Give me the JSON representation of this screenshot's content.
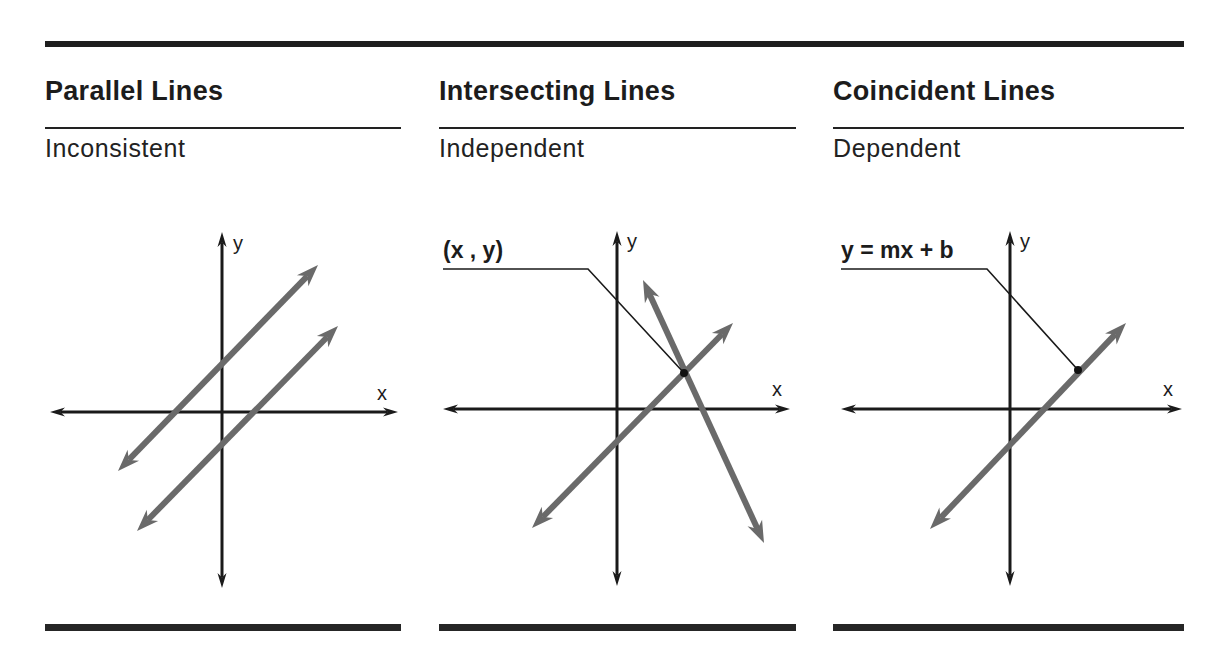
{
  "panels": [
    {
      "id": "parallel",
      "title": "Parallel Lines",
      "subtitle": "Inconsistent",
      "left": 45,
      "width": 356,
      "axes": {
        "y_axis": {
          "x": 222,
          "top": 232,
          "bottom": 588
        },
        "x_axis": {
          "y": 412,
          "left": 50,
          "right": 398
        },
        "y_label": "y",
        "y_label_pos": [
          233,
          250
        ],
        "x_label": "x",
        "x_label_pos": [
          377,
          400
        ]
      },
      "lines": [
        {
          "from": [
            118,
            471
          ],
          "to": [
            318,
            265
          ]
        },
        {
          "from": [
            137,
            531
          ],
          "to": [
            338,
            326
          ]
        }
      ],
      "annotation": null
    },
    {
      "id": "intersecting",
      "title": "Intersecting Lines",
      "subtitle": "Independent",
      "left": 439,
      "width": 357,
      "axes": {
        "y_axis": {
          "x": 617,
          "top": 231,
          "bottom": 586
        },
        "x_axis": {
          "y": 409,
          "left": 443,
          "right": 790
        },
        "y_label": "y",
        "y_label_pos": [
          627,
          248
        ],
        "x_label": "x",
        "x_label_pos": [
          772,
          396
        ]
      },
      "lines": [
        {
          "from": [
            532,
            528
          ],
          "to": [
            733,
            323
          ]
        },
        {
          "from": [
            643,
            280
          ],
          "to": [
            764,
            543
          ]
        }
      ],
      "annotation": {
        "label": "(x , y)",
        "label_pos": [
          443,
          258
        ],
        "leader": [
          [
            443,
            269
          ],
          [
            588,
            269
          ],
          [
            684,
            373
          ]
        ],
        "dot": [
          684,
          373
        ]
      }
    },
    {
      "id": "coincident",
      "title": "Coincident Lines",
      "subtitle": "Dependent",
      "left": 833,
      "width": 351,
      "axes": {
        "y_axis": {
          "x": 1010,
          "top": 231,
          "bottom": 586
        },
        "x_axis": {
          "y": 409,
          "left": 841,
          "right": 1182
        },
        "y_label": "y",
        "y_label_pos": [
          1020,
          248
        ],
        "x_label": "x",
        "x_label_pos": [
          1163,
          396
        ]
      },
      "lines": [
        {
          "from": [
            930,
            529
          ],
          "to": [
            1126,
            323
          ]
        }
      ],
      "annotation": {
        "label": "y = mx + b",
        "label_pos": [
          841,
          258
        ],
        "leader": [
          [
            841,
            269
          ],
          [
            987,
            269
          ],
          [
            1078,
            370
          ]
        ],
        "dot": [
          1078,
          370
        ]
      }
    }
  ],
  "colors": {
    "axis": "#1a1a1a",
    "line": "#6a6a6a",
    "rule": "#1e1e1e",
    "text": "#1c1c1c"
  }
}
